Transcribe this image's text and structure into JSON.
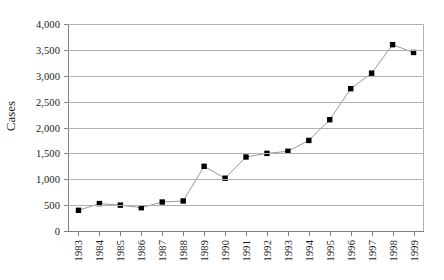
{
  "chart_data": {
    "type": "line",
    "title": "",
    "xlabel": "",
    "ylabel": "Cases",
    "ylim": [
      0,
      4000
    ],
    "ytick_step": 500,
    "grid": true,
    "legend": "none",
    "marker": "square",
    "marker_color": "#000000",
    "line_color": "#999999",
    "gridline_color": "#b0b0b0",
    "background_color": "#ffffff",
    "categories": [
      "1983",
      "1984",
      "1985",
      "1986",
      "1987",
      "1988",
      "1989",
      "1990",
      "1991",
      "1992",
      "1993",
      "1994",
      "1995",
      "1996",
      "1997",
      "1998",
      "1999"
    ],
    "values": [
      400,
      530,
      500,
      450,
      560,
      580,
      1250,
      1020,
      1430,
      1500,
      1540,
      1750,
      2150,
      2750,
      3050,
      3600,
      3450
    ],
    "ytick_labels": [
      "4,000",
      "3,500",
      "3,000",
      "2,500",
      "2,000",
      "1,500",
      "1,000",
      "500",
      "0"
    ],
    "ytick_values": [
      4000,
      3500,
      3000,
      2500,
      2000,
      1500,
      1000,
      500,
      0
    ]
  }
}
